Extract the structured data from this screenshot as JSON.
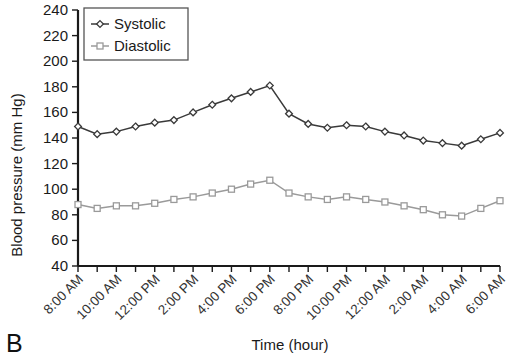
{
  "panel": {
    "label": "B"
  },
  "legend": {
    "position": "top-left-inside",
    "entries": [
      {
        "label": "Systolic",
        "marker": "diamond-marker-icon",
        "color": "#3a3a3a"
      },
      {
        "label": "Diastolic",
        "marker": "square-marker-icon",
        "color": "#9a9a9a"
      }
    ]
  },
  "chart_data": {
    "type": "line",
    "title": "",
    "xlabel": "Time (hour)",
    "ylabel": "Blood pressure (mm Hg)",
    "ylim": [
      40,
      240
    ],
    "yticks": [
      40,
      60,
      80,
      100,
      120,
      140,
      160,
      180,
      200,
      220,
      240
    ],
    "grid": false,
    "legend_position": "upper left",
    "x": [
      "8:00 AM",
      "9:00 AM",
      "10:00 AM",
      "11:00 AM",
      "12:00 PM",
      "1:00 PM",
      "2:00 PM",
      "3:00 PM",
      "4:00 PM",
      "5:00 PM",
      "6:00 PM",
      "7:00 PM",
      "8:00 PM",
      "9:00 PM",
      "10:00 PM",
      "11:00 PM",
      "12:00 AM",
      "1:00 AM",
      "2:00 AM",
      "3:00 AM",
      "4:00 AM",
      "5:00 AM",
      "6:00 AM"
    ],
    "xtick_labels": [
      "8:00 AM",
      "10:00 AM",
      "12:00 PM",
      "2:00 PM",
      "4:00 PM",
      "6:00 PM",
      "8:00 PM",
      "10:00 PM",
      "12:00 AM",
      "2:00 AM",
      "4:00 AM",
      "6:00 AM"
    ],
    "xtick_rotation": 45,
    "series": [
      {
        "name": "Systolic",
        "color": "#3a3a3a",
        "marker": "diamond",
        "values": [
          149,
          143,
          145,
          149,
          152,
          154,
          160,
          166,
          171,
          176,
          181,
          159,
          151,
          148,
          150,
          149,
          145,
          142,
          138,
          136,
          134,
          139,
          144
        ]
      },
      {
        "name": "Diastolic",
        "color": "#9a9a9a",
        "marker": "square",
        "values": [
          88,
          85,
          87,
          87,
          89,
          92,
          94,
          97,
          100,
          104,
          107,
          97,
          94,
          92,
          94,
          92,
          90,
          87,
          84,
          80,
          79,
          85,
          91
        ]
      }
    ]
  }
}
